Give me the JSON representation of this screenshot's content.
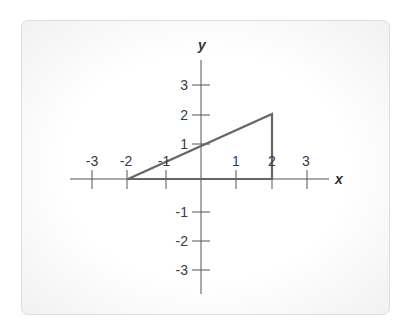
{
  "diagram": {
    "axes": {
      "x_label": "x",
      "y_label": "y",
      "x_ticks": [
        {
          "value": -3,
          "label": "-3"
        },
        {
          "value": -2,
          "label": "-2"
        },
        {
          "value": -1,
          "label": "-1"
        },
        {
          "value": 1,
          "label": "1"
        },
        {
          "value": 2,
          "label": "2"
        },
        {
          "value": 3,
          "label": "3"
        }
      ],
      "y_ticks": [
        {
          "value": 3,
          "label": "3"
        },
        {
          "value": 2,
          "label": "2"
        },
        {
          "value": 1,
          "label": "1"
        },
        {
          "value": -1,
          "label": "-1"
        },
        {
          "value": -2,
          "label": "-2"
        },
        {
          "value": -3,
          "label": "-3"
        }
      ],
      "color": "#555555"
    },
    "triangle": {
      "vertices": [
        [
          -2,
          0
        ],
        [
          2,
          0
        ],
        [
          2,
          2
        ]
      ],
      "stroke": "#666666"
    }
  }
}
